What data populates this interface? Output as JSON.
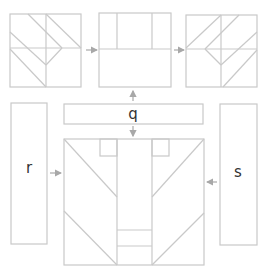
{
  "diagram": {
    "labels": {
      "q": "q",
      "r": "r",
      "s": "s"
    },
    "colors": {
      "line": "#c9c9c9",
      "arrow": "#a8a8a8",
      "text": "#333333",
      "background": "#ffffff"
    },
    "panels": [
      {
        "id": "top-left-pattern",
        "description": "square block with diagonal chevron pieces"
      },
      {
        "id": "top-middle-pattern",
        "description": "square block split into three columns over a wide rectangle"
      },
      {
        "id": "top-right-pattern",
        "description": "mirrored square block with diagonal chevron pieces"
      },
      {
        "id": "strip-q",
        "label_key": "q"
      },
      {
        "id": "strip-r",
        "label_key": "r"
      },
      {
        "id": "strip-s",
        "label_key": "s"
      },
      {
        "id": "bottom-assembly",
        "description": "large block with center column and mirrored diagonals"
      }
    ],
    "flows": [
      {
        "from": "top-left-pattern",
        "to": "top-middle-pattern"
      },
      {
        "from": "top-middle-pattern",
        "to": "top-right-pattern"
      },
      {
        "from": "strip-q",
        "to": "top-middle-pattern"
      },
      {
        "from": "strip-q",
        "to": "bottom-assembly"
      },
      {
        "from": "strip-r",
        "to": "bottom-assembly"
      },
      {
        "from": "strip-s",
        "to": "bottom-assembly"
      }
    ]
  }
}
